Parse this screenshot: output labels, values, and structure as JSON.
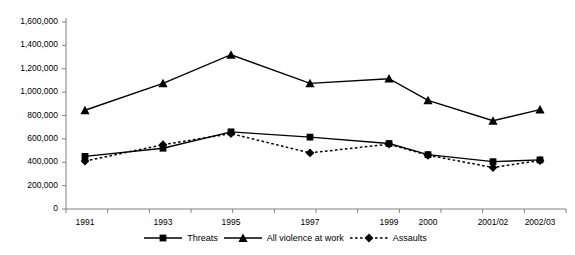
{
  "chart_data": {
    "type": "line",
    "title": "",
    "subtitle": "",
    "xlabel": "",
    "ylabel": "",
    "categories": [
      "1991",
      "1993",
      "1995",
      "1997",
      "1999",
      "2000",
      "2001/02",
      "2002/03"
    ],
    "ylim": [
      0,
      1600000
    ],
    "ytick_values": [
      0,
      200000,
      400000,
      600000,
      800000,
      1000000,
      1200000,
      1400000,
      1600000
    ],
    "ytick_labels": [
      "0",
      "200,000",
      "400,000",
      "600,000",
      "800,000",
      "1,000,000",
      "1,200,000",
      "1,400,000",
      "1,600,000"
    ],
    "grid": false,
    "legend_position": "bottom",
    "series": [
      {
        "name": "Threats",
        "marker": "square",
        "line_style": "solid",
        "color": "#000000",
        "values": [
          450000,
          520000,
          660000,
          615000,
          560000,
          465000,
          405000,
          420000
        ]
      },
      {
        "name": "All violence at work",
        "marker": "triangle",
        "line_style": "solid",
        "color": "#000000",
        "values": [
          845000,
          1075000,
          1320000,
          1075000,
          1115000,
          930000,
          755000,
          850000
        ]
      },
      {
        "name": "Assaults",
        "marker": "diamond",
        "line_style": "dotted",
        "color": "#000000",
        "values": [
          410000,
          550000,
          645000,
          480000,
          555000,
          460000,
          355000,
          415000
        ]
      }
    ]
  },
  "axis": {
    "y_axis_name": "y-axis",
    "x_axis_name": "x-axis"
  },
  "legend": {
    "entries": [
      {
        "label": "Threats",
        "marker": "square-marker-icon",
        "style": "solid"
      },
      {
        "label": "All violence at work",
        "marker": "triangle-marker-icon",
        "style": "solid"
      },
      {
        "label": "Assaults",
        "marker": "diamond-marker-icon",
        "style": "dotted"
      }
    ]
  }
}
